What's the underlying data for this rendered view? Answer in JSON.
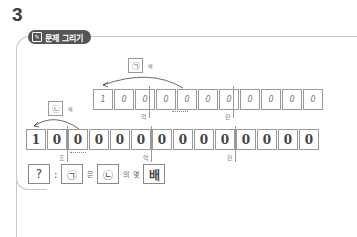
{
  "problem_number": "3",
  "header": {
    "icon": "pencil-board-icon",
    "title": "문제 그리기"
  },
  "top_row": {
    "tag": "㉠",
    "tag_suffix": "배",
    "digits": [
      "1",
      "0",
      "0",
      "0",
      "0",
      "0",
      "0",
      "0",
      "0",
      "0",
      "0"
    ],
    "units": [
      "억",
      "만"
    ]
  },
  "bottom_row": {
    "tag": "㉡",
    "tag_suffix": "배",
    "digits": [
      "1",
      "0",
      "0",
      "0",
      "0",
      "0",
      "0",
      "0",
      "0",
      "0",
      "0",
      "0",
      "0",
      "0"
    ],
    "units": [
      "조",
      "억",
      "만"
    ]
  },
  "answer": {
    "question_mark": "?",
    "colon": ":",
    "a": "㉠",
    "eun": "은",
    "b": "㉡",
    "ui": "의",
    "myeot": "몇",
    "bae": "배"
  }
}
